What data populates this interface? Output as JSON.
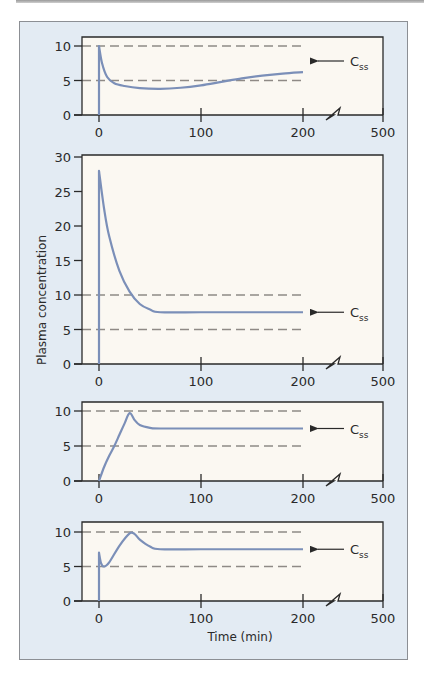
{
  "figure": {
    "y_axis_label": "Plasma concentration",
    "x_axis_label": "Time (min)",
    "css_label_main": "C",
    "css_label_sub": "ss",
    "colors": {
      "panel_background": "#e3ebf3",
      "plot_background": "#fbf8f2",
      "curve": "#7b8fb8",
      "dashed_line": "#8f8a86",
      "axis": "#2a2a2a"
    }
  },
  "chart_data": [
    {
      "type": "line",
      "title": "",
      "xlabel": "",
      "ylabel": "",
      "x_tick_labels": [
        "0",
        "100",
        "200",
        "500"
      ],
      "y_tick_labels": [
        "0",
        "5",
        "10"
      ],
      "ylim": [
        0,
        10
      ],
      "x_axis_break": "between 200 and 500",
      "reference_lines": [
        5,
        10
      ],
      "annotation": "Css",
      "series": [
        {
          "name": "Concentration",
          "x": [
            0,
            0,
            3,
            8,
            15,
            25,
            40,
            60,
            80,
            100,
            120,
            140,
            160,
            180,
            200
          ],
          "values": [
            0,
            10,
            7.5,
            5.5,
            4.6,
            4.2,
            3.9,
            3.8,
            3.95,
            4.3,
            4.8,
            5.3,
            5.7,
            6.0,
            6.2
          ]
        }
      ]
    },
    {
      "type": "line",
      "title": "",
      "xlabel": "",
      "ylabel": "Plasma concentration",
      "x_tick_labels": [
        "0",
        "100",
        "200",
        "500"
      ],
      "y_tick_labels": [
        "0",
        "5",
        "10",
        "15",
        "20",
        "25",
        "30"
      ],
      "ylim": [
        0,
        30
      ],
      "x_axis_break": "between 200 and 500",
      "reference_lines": [
        5,
        10
      ],
      "annotation": "Css",
      "series": [
        {
          "name": "Concentration",
          "x": [
            0,
            0,
            5,
            10,
            20,
            30,
            40,
            50,
            60,
            100,
            150,
            200
          ],
          "values": [
            0,
            28,
            22.5,
            18.5,
            13.5,
            10.5,
            8.7,
            7.9,
            7.5,
            7.5,
            7.5,
            7.5
          ]
        }
      ]
    },
    {
      "type": "line",
      "title": "",
      "xlabel": "",
      "ylabel": "",
      "x_tick_labels": [
        "0",
        "100",
        "200",
        "500"
      ],
      "y_tick_labels": [
        "0",
        "5",
        "10"
      ],
      "ylim": [
        0,
        10
      ],
      "x_axis_break": "between 200 and 500",
      "reference_lines": [
        5,
        10
      ],
      "annotation": "Css",
      "series": [
        {
          "name": "Concentration",
          "x": [
            0,
            5,
            10,
            15,
            20,
            25,
            30,
            35,
            40,
            50,
            60,
            100,
            150,
            200
          ],
          "values": [
            0,
            2.0,
            3.6,
            5.0,
            6.6,
            8.2,
            9.7,
            8.7,
            8.0,
            7.6,
            7.5,
            7.5,
            7.5,
            7.5
          ]
        }
      ]
    },
    {
      "type": "line",
      "title": "",
      "xlabel": "Time (min)",
      "ylabel": "",
      "x_tick_labels": [
        "0",
        "100",
        "200",
        "500"
      ],
      "y_tick_labels": [
        "0",
        "5",
        "10"
      ],
      "ylim": [
        0,
        10
      ],
      "x_axis_break": "between 200 and 500",
      "reference_lines": [
        5,
        10
      ],
      "annotation": "Css",
      "series": [
        {
          "name": "Concentration",
          "x": [
            0,
            0,
            2,
            5,
            10,
            20,
            30,
            35,
            40,
            50,
            60,
            100,
            150,
            200
          ],
          "values": [
            0,
            7.0,
            5.5,
            5.0,
            5.6,
            8.0,
            9.8,
            9.7,
            8.9,
            7.9,
            7.5,
            7.5,
            7.5,
            7.5
          ]
        }
      ]
    }
  ]
}
